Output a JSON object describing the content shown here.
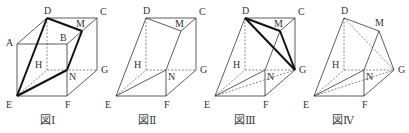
{
  "figures": [
    {
      "id": "fig1",
      "caption": "図Ⅰ",
      "vertices": [
        "A",
        "B",
        "C",
        "D",
        "E",
        "F",
        "G",
        "H",
        "M",
        "N"
      ],
      "edges": [
        {
          "from": "A",
          "to": "B",
          "style": "solid"
        },
        {
          "from": "A",
          "to": "D",
          "style": "solid"
        },
        {
          "from": "D",
          "to": "C",
          "style": "solid"
        },
        {
          "from": "B",
          "to": "C",
          "style": "solid"
        },
        {
          "from": "A",
          "to": "E",
          "style": "solid"
        },
        {
          "from": "B",
          "to": "F",
          "style": "solid"
        },
        {
          "from": "C",
          "to": "G",
          "style": "solid"
        },
        {
          "from": "E",
          "to": "F",
          "style": "solid"
        },
        {
          "from": "F",
          "to": "G",
          "style": "solid"
        },
        {
          "from": "D",
          "to": "H",
          "style": "dashed"
        },
        {
          "from": "H",
          "to": "G",
          "style": "dashed"
        },
        {
          "from": "E",
          "to": "H",
          "style": "dashed"
        },
        {
          "from": "D",
          "to": "E",
          "style": "bold"
        },
        {
          "from": "D",
          "to": "M",
          "style": "bold"
        },
        {
          "from": "M",
          "to": "N",
          "style": "bold"
        },
        {
          "from": "N",
          "to": "E",
          "style": "bold"
        }
      ]
    },
    {
      "id": "fig2",
      "caption": "図Ⅱ",
      "vertices": [
        "C",
        "D",
        "E",
        "F",
        "G",
        "H",
        "M",
        "N"
      ],
      "edges": [
        {
          "from": "D",
          "to": "C",
          "style": "solid"
        },
        {
          "from": "D",
          "to": "M",
          "style": "solid"
        },
        {
          "from": "M",
          "to": "C",
          "style": "solid"
        },
        {
          "from": "C",
          "to": "G",
          "style": "solid"
        },
        {
          "from": "D",
          "to": "E",
          "style": "solid"
        },
        {
          "from": "M",
          "to": "N",
          "style": "solid"
        },
        {
          "from": "E",
          "to": "N",
          "style": "solid"
        },
        {
          "from": "E",
          "to": "F",
          "style": "solid"
        },
        {
          "from": "F",
          "to": "N",
          "style": "solid"
        },
        {
          "from": "F",
          "to": "G",
          "style": "solid"
        },
        {
          "from": "D",
          "to": "H",
          "style": "dashed"
        },
        {
          "from": "H",
          "to": "G",
          "style": "dashed"
        },
        {
          "from": "E",
          "to": "H",
          "style": "dashed"
        }
      ]
    },
    {
      "id": "fig3",
      "caption": "図Ⅲ",
      "vertices": [
        "C",
        "D",
        "E",
        "F",
        "G",
        "H",
        "M",
        "N"
      ],
      "edges": [
        {
          "from": "D",
          "to": "C",
          "style": "solid"
        },
        {
          "from": "M",
          "to": "C",
          "style": "solid"
        },
        {
          "from": "C",
          "to": "G",
          "style": "solid"
        },
        {
          "from": "D",
          "to": "E",
          "style": "solid"
        },
        {
          "from": "M",
          "to": "N",
          "style": "solid"
        },
        {
          "from": "E",
          "to": "N",
          "style": "solid"
        },
        {
          "from": "E",
          "to": "F",
          "style": "solid"
        },
        {
          "from": "F",
          "to": "N",
          "style": "solid"
        },
        {
          "from": "F",
          "to": "G",
          "style": "solid"
        },
        {
          "from": "D",
          "to": "H",
          "style": "dashed"
        },
        {
          "from": "H",
          "to": "G",
          "style": "dashed"
        },
        {
          "from": "E",
          "to": "H",
          "style": "dashed"
        },
        {
          "from": "E",
          "to": "G",
          "style": "dashed"
        },
        {
          "from": "D",
          "to": "M",
          "style": "bold"
        },
        {
          "from": "M",
          "to": "G",
          "style": "bold"
        },
        {
          "from": "D",
          "to": "G",
          "style": "bold"
        }
      ]
    },
    {
      "id": "fig4",
      "caption": "図Ⅳ",
      "vertices": [
        "D",
        "E",
        "F",
        "G",
        "H",
        "M",
        "N"
      ],
      "edges": [
        {
          "from": "D",
          "to": "M",
          "style": "solid"
        },
        {
          "from": "D",
          "to": "E",
          "style": "solid"
        },
        {
          "from": "M",
          "to": "N",
          "style": "solid"
        },
        {
          "from": "M",
          "to": "G",
          "style": "solid"
        },
        {
          "from": "E",
          "to": "N",
          "style": "solid"
        },
        {
          "from": "E",
          "to": "F",
          "style": "solid"
        },
        {
          "from": "F",
          "to": "N",
          "style": "solid"
        },
        {
          "from": "F",
          "to": "G",
          "style": "solid"
        },
        {
          "from": "D",
          "to": "H",
          "style": "dashed"
        },
        {
          "from": "D",
          "to": "G",
          "style": "dashed"
        },
        {
          "from": "H",
          "to": "G",
          "style": "dashed"
        },
        {
          "from": "E",
          "to": "H",
          "style": "dashed"
        },
        {
          "from": "E",
          "to": "G",
          "style": "dashed"
        }
      ]
    }
  ]
}
